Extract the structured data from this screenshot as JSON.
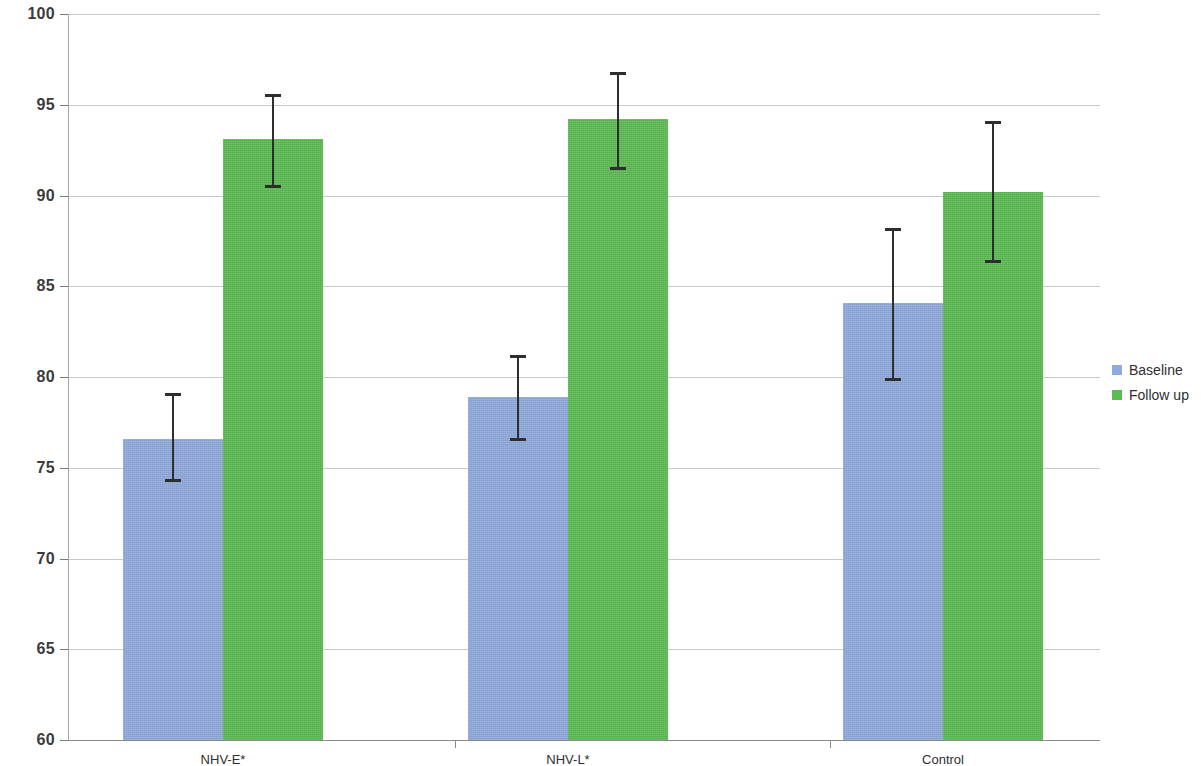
{
  "chart_data": {
    "type": "bar",
    "title": "",
    "subtitle": "",
    "xlabel": "",
    "ylabel": "",
    "ylim": [
      60,
      100
    ],
    "ytick_step": 5,
    "yticks": [
      100,
      95,
      90,
      85,
      80,
      75,
      70,
      65,
      60
    ],
    "ytick_labels": [
      "100",
      "95",
      "90",
      "85",
      "80",
      "75",
      "70",
      "65",
      "60"
    ],
    "grid": true,
    "grid_axis": "y",
    "legend_position": "right",
    "categories": [
      "NHV-E*",
      "NHV-L*",
      "Control"
    ],
    "series": [
      {
        "name": "Baseline",
        "color": "#8FAADC",
        "values": [
          76.6,
          78.9,
          84.1
        ],
        "error_low": [
          74.2,
          76.5,
          79.8
        ],
        "error_high": [
          79.1,
          81.2,
          88.2
        ]
      },
      {
        "name": "Follow up",
        "color": "#5CBB52",
        "values": [
          93.1,
          94.2,
          90.2
        ],
        "error_low": [
          90.4,
          91.4,
          86.3
        ],
        "error_high": [
          95.6,
          96.8,
          94.1
        ]
      }
    ],
    "annotations": []
  },
  "legend": {
    "items": [
      {
        "label": "Baseline",
        "color": "#8FAADC"
      },
      {
        "label": "Follow up",
        "color": "#5CBB52"
      }
    ]
  },
  "axis": {
    "y_labels": [
      "100",
      "95",
      "90",
      "85",
      "80",
      "75",
      "70",
      "65",
      "60"
    ],
    "x_labels": [
      "NHV-E*",
      "NHV-L*",
      "Control"
    ]
  }
}
